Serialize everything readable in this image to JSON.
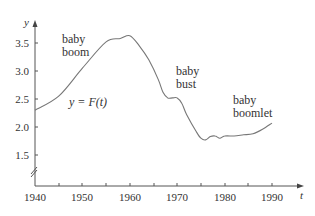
{
  "chart_data": {
    "type": "line",
    "title": "",
    "xlabel": "t",
    "ylabel": "y",
    "xlim": [
      1940,
      1995
    ],
    "ylim": [
      1.0,
      3.8
    ],
    "x_ticks": [
      1940,
      1950,
      1960,
      1970,
      1980,
      1990
    ],
    "x_tick_labels": [
      "1940",
      "1950",
      "1960",
      "1970",
      "1980",
      "1990"
    ],
    "x_minor_ticks": [
      1945,
      1955,
      1965,
      1975,
      1985
    ],
    "y_ticks": [
      1.5,
      2.0,
      2.5,
      3.0,
      3.5
    ],
    "y_tick_labels": [
      "1.5",
      "2.0",
      "2.5",
      "3.0",
      "3.5"
    ],
    "y_axis_break": true,
    "grid": false,
    "legend": null,
    "series": [
      {
        "name": "y = F(t)",
        "x": [
          1940,
          1945,
          1950,
          1955,
          1958,
          1960,
          1962,
          1964,
          1966,
          1967,
          1968,
          1969,
          1970,
          1971,
          1972,
          1974,
          1975,
          1976,
          1977,
          1978,
          1979,
          1980,
          1982,
          1984,
          1986,
          1988,
          1990
        ],
        "values": [
          2.3,
          2.55,
          3.05,
          3.52,
          3.58,
          3.63,
          3.45,
          3.2,
          2.85,
          2.62,
          2.52,
          2.52,
          2.52,
          2.42,
          2.22,
          1.92,
          1.8,
          1.77,
          1.83,
          1.84,
          1.8,
          1.84,
          1.84,
          1.86,
          1.88,
          1.96,
          2.07
        ]
      }
    ],
    "annotations": [
      {
        "text": "baby\nboom",
        "x": 1947,
        "y": 3.55
      },
      {
        "text": "baby\nbust",
        "x": 1971,
        "y": 2.75
      },
      {
        "text": "baby\nboomlet",
        "x": 1981,
        "y": 2.2
      },
      {
        "text": "y = F(t)",
        "x": 1945,
        "y": 2.3
      }
    ]
  },
  "axes": {
    "x_label": "t",
    "y_label": "y",
    "x_tick_labels": [
      "1940",
      "1950",
      "1960",
      "1970",
      "1980",
      "1990"
    ],
    "y_tick_labels": [
      "3.5",
      "3.0",
      "2.5",
      "2.0",
      "1.5"
    ]
  },
  "annotations": {
    "boom_line1": "baby",
    "boom_line2": "boom",
    "bust_line1": "baby",
    "bust_line2": "bust",
    "boomlet_line1": "baby",
    "boomlet_line2": "boomlet",
    "function_label": "y = F(t)"
  }
}
